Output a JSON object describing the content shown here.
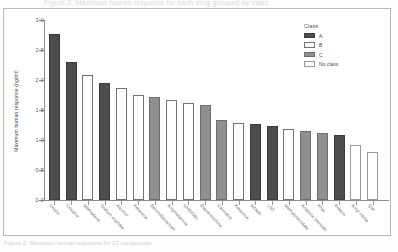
{
  "figure": {
    "top_caption": "Figure 2. Maximum human response for each drug grouped by class",
    "bottom_caption": "Figure 2. Maximum human exposure for 22 compounds."
  },
  "legend": {
    "title": "Class",
    "position": "top-right",
    "entries": [
      {
        "label": "A",
        "key": "A",
        "color": "#4d4d4d"
      },
      {
        "label": "B",
        "key": "B",
        "color": "#ffffff"
      },
      {
        "label": "C",
        "key": "C",
        "color": "#8f8f8f"
      },
      {
        "label": "No class",
        "key": "N",
        "color": "#ffffff"
      }
    ]
  },
  "chart_data": {
    "type": "bar",
    "title": "",
    "xlabel": "",
    "ylabel": "Maximum human response (ng/ml)",
    "ylim": [
      0.0,
      3.0
    ],
    "yticks": [
      "0.0",
      "0.5",
      "1.0",
      "1.5",
      "2.0",
      "2.5",
      "3.0"
    ],
    "ytick_values": [
      0.0,
      0.5,
      1.0,
      1.5,
      2.0,
      2.5,
      3.0
    ],
    "grid": false,
    "legend_title": "Class",
    "categories": [
      "Insulin",
      "Cocaine",
      "Methadone",
      "Sodium oxybate",
      "Alcohol",
      "Ketamine",
      "Benzodiazepines",
      "Amphetamine",
      "GHB/GBL",
      "Buprenorphine",
      "Cannabis",
      "Ketamine",
      "MDMA",
      "LSD",
      "Methylphenidate",
      "Anabolic steroids",
      "Khat",
      "Kratom",
      "Amyl nitrite",
      "Qat"
    ],
    "values": [
      2.77,
      2.3,
      2.08,
      1.95,
      1.86,
      1.75,
      1.71,
      1.66,
      1.62,
      1.58,
      1.34,
      1.28,
      1.26,
      1.24,
      1.19,
      1.15,
      1.11,
      1.08,
      0.92,
      0.8
    ],
    "classes": [
      "A",
      "A",
      "B",
      "A",
      "B",
      "B",
      "C",
      "B",
      "B",
      "C",
      "C",
      "B",
      "A",
      "A",
      "B",
      "C",
      "C",
      "A",
      "N",
      "N"
    ]
  }
}
